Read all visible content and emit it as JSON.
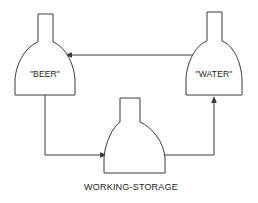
{
  "diagram": {
    "background_color": "#ffffff",
    "line_color": "#3a3a3a",
    "text_color": "#1c1c1c",
    "nodes": [
      {
        "id": "beer",
        "label": "\"BEER\"",
        "label_position": "inside",
        "shape": "flask"
      },
      {
        "id": "water",
        "label": "\"WATER\"",
        "label_position": "inside",
        "shape": "flask"
      },
      {
        "id": "working_storage",
        "label": "WORKING-STORAGE",
        "label_position": "below",
        "shape": "flask"
      }
    ],
    "edges": [
      {
        "id": "water-to-beer",
        "from": "water",
        "to": "beer",
        "arrow": "to",
        "routing": "horizontal-top"
      },
      {
        "id": "beer-to-working-storage",
        "from": "beer",
        "to": "working_storage",
        "arrow": "to",
        "routing": "down-then-right"
      },
      {
        "id": "working-storage-to-water",
        "from": "working_storage",
        "to": "water",
        "arrow": "to",
        "routing": "right-then-up"
      }
    ]
  }
}
